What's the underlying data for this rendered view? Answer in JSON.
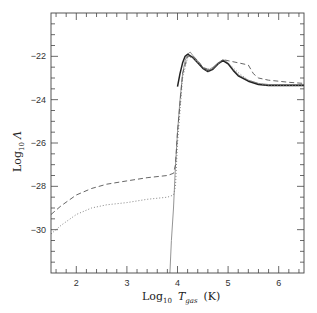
{
  "chart_data": {
    "type": "line",
    "title": "",
    "xlabel": "Log10 Tgas (K)",
    "xlabel_parts": {
      "log": "Log",
      "sub": "10",
      "var": "T",
      "var_sub": "gas",
      "unit": "(K)"
    },
    "ylabel": "Log10 Λ",
    "ylabel_parts": {
      "log": "Log",
      "sub": "10",
      "var": "Λ"
    },
    "xlim": [
      1.5,
      6.5
    ],
    "ylim": [
      -32,
      -20
    ],
    "x_ticks": [
      "2",
      "3",
      "4",
      "5",
      "6"
    ],
    "y_ticks": [
      "-22",
      "-24",
      "-26",
      "-28",
      "-30"
    ],
    "grid": false,
    "legend": null,
    "series": [
      {
        "name": "solid-thin (gray)",
        "style": "solid",
        "color": "#888888",
        "x": [
          3.85,
          3.88,
          3.92,
          3.96,
          4.0,
          4.05,
          4.1,
          4.15,
          4.2,
          4.25,
          4.3,
          4.4,
          4.5,
          4.6,
          4.7,
          4.8,
          4.9,
          5.0,
          5.1,
          5.2,
          5.4,
          5.6,
          5.8,
          6.0,
          6.2,
          6.5
        ],
        "y": [
          -32.0,
          -30.5,
          -29.0,
          -27.0,
          -25.5,
          -24.0,
          -22.8,
          -22.2,
          -21.9,
          -21.8,
          -21.95,
          -22.2,
          -22.5,
          -22.65,
          -22.5,
          -22.3,
          -22.15,
          -22.3,
          -22.6,
          -22.85,
          -23.1,
          -23.25,
          -23.3,
          -23.3,
          -23.3,
          -23.3
        ]
      },
      {
        "name": "solid-thick (black)",
        "style": "solid",
        "color": "#222222",
        "x": [
          4.0,
          4.05,
          4.1,
          4.15,
          4.2,
          4.3,
          4.4,
          4.5,
          4.6,
          4.7,
          4.8,
          4.9,
          5.0,
          5.1,
          5.2,
          5.4,
          5.6,
          5.8,
          6.0,
          6.2,
          6.5
        ],
        "y": [
          -23.4,
          -22.8,
          -22.3,
          -22.0,
          -21.9,
          -22.05,
          -22.3,
          -22.55,
          -22.7,
          -22.6,
          -22.35,
          -22.2,
          -22.35,
          -22.65,
          -22.9,
          -23.15,
          -23.3,
          -23.35,
          -23.35,
          -23.35,
          -23.35
        ]
      },
      {
        "name": "dashed",
        "style": "dashed",
        "color": "#555555",
        "x": [
          1.5,
          1.7,
          2.0,
          2.3,
          2.6,
          3.0,
          3.4,
          3.8,
          3.92,
          3.96,
          4.0,
          4.1,
          4.2,
          4.3,
          4.4,
          4.5,
          4.6,
          4.7,
          4.8,
          4.9,
          5.0,
          5.2,
          5.4,
          5.5,
          5.6,
          5.8,
          6.0,
          6.2,
          6.5
        ],
        "y": [
          -29.3,
          -28.9,
          -28.4,
          -28.1,
          -27.9,
          -27.75,
          -27.6,
          -27.5,
          -27.4,
          -27.0,
          -25.5,
          -22.8,
          -22.0,
          -22.0,
          -22.2,
          -22.5,
          -22.6,
          -22.55,
          -22.35,
          -22.15,
          -22.2,
          -22.3,
          -22.4,
          -22.8,
          -23.0,
          -23.1,
          -23.15,
          -23.2,
          -23.25
        ]
      },
      {
        "name": "dotted",
        "style": "dotted",
        "color": "#777777",
        "x": [
          1.5,
          1.7,
          2.0,
          2.3,
          2.6,
          3.0,
          3.4,
          3.8,
          3.92,
          3.96,
          4.0,
          4.1,
          4.2,
          4.3,
          4.4,
          4.5,
          4.6,
          4.7,
          4.8,
          4.9,
          5.0,
          5.2,
          5.4,
          5.6,
          5.8,
          6.0,
          6.2,
          6.5
        ],
        "y": [
          -30.2,
          -29.8,
          -29.3,
          -29.0,
          -28.85,
          -28.75,
          -28.6,
          -28.5,
          -28.4,
          -28.0,
          -26.0,
          -23.0,
          -22.05,
          -22.05,
          -22.3,
          -22.55,
          -22.7,
          -22.6,
          -22.35,
          -22.15,
          -22.3,
          -22.75,
          -23.1,
          -23.25,
          -23.35,
          -23.35,
          -23.35,
          -23.35
        ]
      }
    ]
  }
}
